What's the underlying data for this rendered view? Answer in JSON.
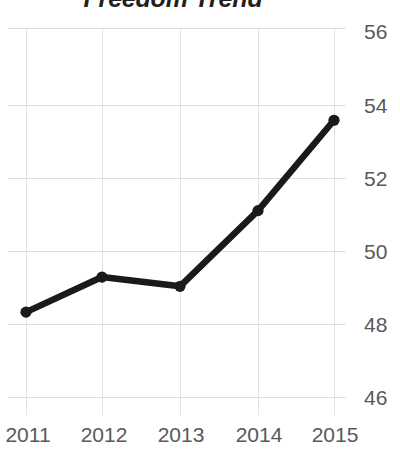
{
  "chart_data": {
    "type": "line",
    "title": "Freedom Trend",
    "xlabel": "",
    "ylabel": "",
    "categories": [
      "2011",
      "2012",
      "2013",
      "2014",
      "2015"
    ],
    "x": [
      2011,
      2012,
      2013,
      2014,
      2015
    ],
    "values": [
      48.3,
      49.25,
      49.0,
      51.05,
      53.5
    ],
    "series": [
      {
        "name": "Freedom Trend",
        "values": [
          48.3,
          49.25,
          49.0,
          51.05,
          53.5
        ]
      }
    ],
    "ylim": [
      46,
      56
    ],
    "yticks": [
      46,
      48,
      50,
      52,
      54,
      56
    ],
    "ytick_labels": [
      "46",
      "48",
      "50",
      "52",
      "54",
      "56"
    ],
    "xticks": [
      2011,
      2012,
      2013,
      2014,
      2015
    ],
    "xtick_labels": [
      "2011",
      "2012",
      "2013",
      "2014",
      "2015"
    ],
    "grid": true,
    "grid_axis": "both",
    "legend": false,
    "legend_position": "none",
    "y_axis_position": "right",
    "marker": "circle",
    "colors": {
      "line": "#1a1a1a",
      "marker": "#1a1a1a",
      "grid": "#dedede",
      "title": "#231f20",
      "tick_label": "#58595b",
      "background": "#ffffff"
    }
  }
}
